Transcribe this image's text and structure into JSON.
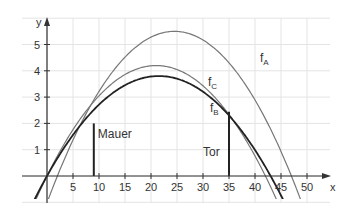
{
  "chart_data": {
    "type": "line",
    "title": "",
    "xlabel": "x",
    "ylabel": "y",
    "xlim": [
      -5,
      53
    ],
    "ylim": [
      -1.4,
      6
    ],
    "grid": true,
    "x_ticks": [
      5,
      10,
      15,
      20,
      25,
      30,
      35,
      40,
      45,
      50
    ],
    "y_ticks": [
      1,
      2,
      3,
      4,
      5
    ],
    "series": [
      {
        "name": "f_A",
        "label": "f",
        "sub": "A",
        "color": "#777777",
        "roots": [
          2,
          47
        ],
        "vertex": [
          24.5,
          5.5
        ]
      },
      {
        "name": "f_C",
        "label": "f",
        "sub": "C",
        "color": "#777777",
        "roots": [
          0,
          42
        ],
        "vertex": [
          21,
          4.2
        ]
      },
      {
        "name": "f_B",
        "label": "f",
        "sub": "B",
        "color": "#222222",
        "roots": [
          0,
          43
        ],
        "vertex": [
          21.5,
          3.8
        ]
      }
    ],
    "annotations": [
      {
        "type": "vline",
        "x": 9,
        "y_top": 2,
        "label": "Mauer"
      },
      {
        "type": "vline",
        "x": 35,
        "y_top": 2.44,
        "label": "Tor"
      }
    ]
  }
}
